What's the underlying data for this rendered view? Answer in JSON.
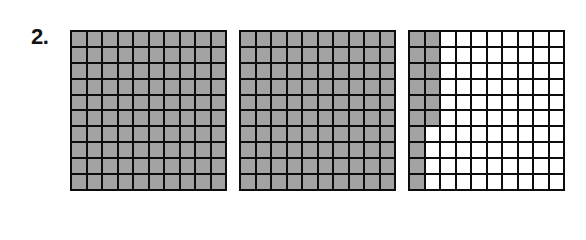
{
  "problem": {
    "number_label": "2.",
    "grids": [
      {
        "name": "grid-1",
        "rows": 10,
        "cols": 10,
        "shaded_cells": 100,
        "shading": "all"
      },
      {
        "name": "grid-2",
        "rows": 10,
        "cols": 10,
        "shaded_cells": 100,
        "shading": "all"
      },
      {
        "name": "grid-3",
        "rows": 10,
        "cols": 10,
        "shaded_cells": 16,
        "shading": "column 1 full (10), column 2 top 6 rows"
      }
    ],
    "total_shaded_hundredths": 216
  },
  "colors": {
    "shaded": "#a3a3a3",
    "unshaded": "#ffffff",
    "border": "#0d0d0d"
  }
}
